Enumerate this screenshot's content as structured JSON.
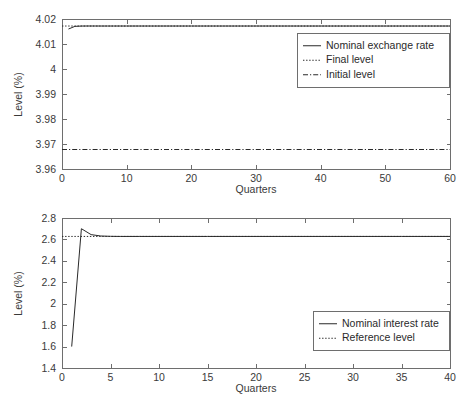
{
  "figure": {
    "background_color": "#ffffff",
    "line_color": "#2a2a2a",
    "axis_color": "#6e6e6e"
  },
  "chart_data": [
    {
      "type": "line",
      "id": "nominal-exchange-rate-chart",
      "title": "",
      "xlabel": "Quarters",
      "ylabel": "Level (%)",
      "xlim": [
        0,
        60
      ],
      "ylim": [
        3.96,
        4.02
      ],
      "grid": false,
      "legend_position": "upper right",
      "xticks": [
        0,
        10,
        20,
        30,
        40,
        50,
        60
      ],
      "xticklabels": [
        "0",
        "10",
        "20",
        "30",
        "40",
        "50",
        "60"
      ],
      "yticks": [
        3.96,
        3.97,
        3.98,
        3.99,
        4.0,
        4.01,
        4.02
      ],
      "yticklabels": [
        "3.96",
        "3.97",
        "3.98",
        "3.99",
        "4",
        "4.01",
        "4.02"
      ],
      "series": [
        {
          "name": "Nominal exchange rate",
          "style": "solid",
          "x": [
            1,
            2,
            3,
            4,
            5,
            6,
            7,
            8,
            9,
            10,
            12,
            15,
            20,
            25,
            30,
            35,
            40,
            45,
            50,
            55,
            60
          ],
          "values": [
            4.016,
            4.01705,
            4.01718,
            4.0172,
            4.0172,
            4.01719,
            4.01719,
            4.01719,
            4.01719,
            4.01719,
            4.01719,
            4.01719,
            4.01719,
            4.01719,
            4.01719,
            4.01719,
            4.01719,
            4.01719,
            4.01719,
            4.01719,
            4.01719
          ]
        },
        {
          "name": "Final level",
          "style": "dotted",
          "x": [
            0,
            60
          ],
          "values": [
            4.01719,
            4.01719
          ]
        },
        {
          "name": "Initial level",
          "style": "dashdot",
          "x": [
            0,
            60
          ],
          "values": [
            3.9678,
            3.9678
          ]
        }
      ]
    },
    {
      "type": "line",
      "id": "nominal-interest-rate-chart",
      "title": "",
      "xlabel": "Quarters",
      "ylabel": "Level (%)",
      "xlim": [
        0,
        40
      ],
      "ylim": [
        1.4,
        2.8
      ],
      "grid": false,
      "legend_position": "center right",
      "xticks": [
        0,
        5,
        10,
        15,
        20,
        25,
        30,
        35,
        40
      ],
      "xticklabels": [
        "0",
        "5",
        "10",
        "15",
        "20",
        "25",
        "30",
        "35",
        "40"
      ],
      "yticks": [
        1.4,
        1.6,
        1.8,
        2.0,
        2.2,
        2.4,
        2.6,
        2.8
      ],
      "yticklabels": [
        "1.4",
        "1.6",
        "1.8",
        "2",
        "2.2",
        "2.4",
        "2.6",
        "2.8"
      ],
      "series": [
        {
          "name": "Nominal interest rate",
          "style": "solid",
          "x": [
            1,
            2,
            3,
            4,
            5,
            6,
            8,
            10,
            15,
            20,
            25,
            30,
            35,
            40
          ],
          "values": [
            1.6,
            2.7,
            2.645,
            2.632,
            2.629,
            2.628,
            2.628,
            2.628,
            2.628,
            2.628,
            2.628,
            2.628,
            2.628,
            2.628
          ]
        },
        {
          "name": "Reference level",
          "style": "dotted",
          "x": [
            0,
            40
          ],
          "values": [
            2.628,
            2.628
          ]
        }
      ]
    }
  ]
}
